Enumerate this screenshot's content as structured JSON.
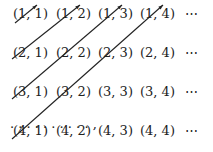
{
  "grid": {
    "rows": [
      [
        "(1, 1)",
        "(1, 2)",
        "(1, 3)",
        "(1, 4)",
        "⋯"
      ],
      [
        "(2, 1)",
        "(2, 2)",
        "(2, 3)",
        "(2, 4)",
        "⋯"
      ],
      [
        "(3, 1)",
        "(3, 2)",
        "(3, 3)",
        "(3, 4)",
        "⋯"
      ],
      [
        "(4, 1)",
        "(4, 2)",
        "(4, 3)",
        "(4, 4)",
        "⋯"
      ]
    ],
    "bottom_row": ". . . . . . . . . . ,"
  },
  "diagonals": [
    {
      "from": [
        15,
        23
      ],
      "to": [
        37,
        5
      ]
    },
    {
      "from": [
        12,
        59
      ],
      "to": [
        80,
        5
      ]
    },
    {
      "from": [
        12,
        99
      ],
      "to": [
        122,
        5
      ]
    },
    {
      "from": [
        12,
        139
      ],
      "to": [
        163,
        5
      ]
    }
  ]
}
